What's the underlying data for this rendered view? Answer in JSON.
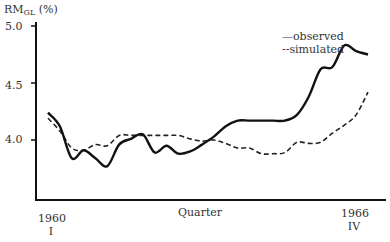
{
  "chart_data": {
    "type": "line",
    "title": "",
    "ylabel": "RM_GL (%)",
    "ylabel_main": "RM",
    "ylabel_sub": "GL",
    "ylabel_unit": "(%)",
    "xlabel": "Quarter",
    "ylim": [
      3.5,
      5.05
    ],
    "yticks": [
      4.0,
      4.5,
      5.0
    ],
    "ytick_labels": [
      "4.0",
      "4.5",
      "5.0"
    ],
    "x_start_label": [
      "1960",
      "I"
    ],
    "x_end_label": [
      "1966",
      "IV"
    ],
    "grid": false,
    "legend_position": "upper right",
    "x": [
      "1960 I",
      "1960 II",
      "1960 III",
      "1960 IV",
      "1961 I",
      "1961 II",
      "1961 III",
      "1961 IV",
      "1962 I",
      "1962 II",
      "1962 III",
      "1962 IV",
      "1963 I",
      "1963 II",
      "1963 III",
      "1963 IV",
      "1964 I",
      "1964 II",
      "1964 III",
      "1964 IV",
      "1965 I",
      "1965 II",
      "1965 III",
      "1965 IV",
      "1966 I",
      "1966 II",
      "1966 III",
      "1966 IV"
    ],
    "series": [
      {
        "name": "observed",
        "style": "solid",
        "values": [
          4.24,
          4.12,
          3.84,
          3.91,
          3.84,
          3.77,
          3.96,
          4.01,
          4.05,
          3.89,
          3.95,
          3.88,
          3.9,
          3.96,
          4.03,
          4.12,
          4.17,
          4.17,
          4.17,
          4.17,
          4.17,
          4.22,
          4.38,
          4.62,
          4.64,
          4.83,
          4.78,
          4.75
        ]
      },
      {
        "name": "simulated",
        "style": "dashed",
        "values": [
          4.19,
          4.08,
          3.93,
          3.91,
          3.96,
          3.95,
          4.04,
          4.04,
          4.04,
          4.04,
          4.04,
          4.04,
          4.01,
          3.99,
          4.0,
          3.97,
          3.93,
          3.93,
          3.88,
          3.88,
          3.89,
          3.98,
          3.97,
          3.98,
          4.06,
          4.13,
          4.22,
          4.42
        ]
      }
    ]
  },
  "legend": {
    "observed": "—observed",
    "simulated": "--simulated"
  }
}
